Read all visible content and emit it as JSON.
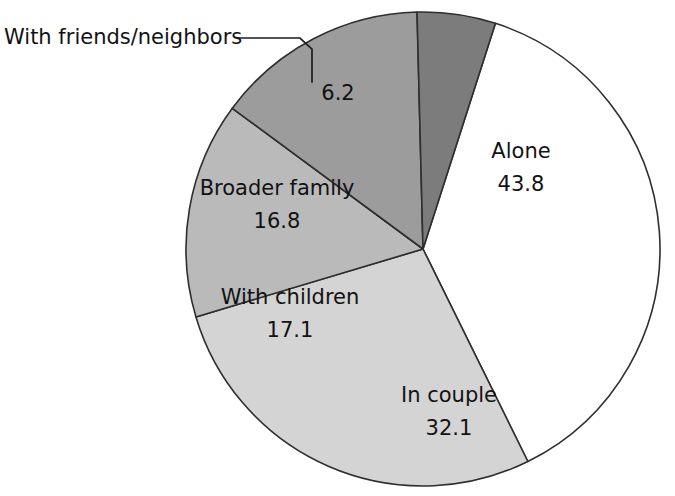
{
  "chart_data": {
    "type": "pie",
    "title": "",
    "subtitle": "",
    "xlabel": "",
    "ylabel": "",
    "grid": false,
    "legend_position": "none",
    "label_style": "inside-slice-with-callout",
    "categories": [
      "Alone",
      "In couple",
      "With children",
      "Broader family",
      "With friends/neighbors"
    ],
    "values": [
      43.8,
      32.1,
      17.1,
      16.8,
      6.2
    ],
    "slices": [
      {
        "label": "Alone",
        "value": "43.8",
        "value_number": 43.8,
        "color": "#ffffff",
        "label_inside": true,
        "start_angle_deg": -74,
        "end_angle_deg": 61.8
      },
      {
        "label": "In couple",
        "value": "32.1",
        "value_number": 32.1,
        "color": "#d4d4d4",
        "label_inside": true,
        "start_angle_deg": 61.8,
        "end_angle_deg": 161.4
      },
      {
        "label": "With children",
        "value": "17.1",
        "value_number": 17.1,
        "color": "#bababa",
        "label_inside": true,
        "start_angle_deg": 161.4,
        "end_angle_deg": 214.4
      },
      {
        "label": "Broader family",
        "value": "16.8",
        "value_number": 16.8,
        "color": "#9c9c9c",
        "label_inside": true,
        "start_angle_deg": 214.4,
        "end_angle_deg": 266.8
      },
      {
        "label": "With friends/neighbors",
        "value": "6.2",
        "value_number": 6.2,
        "color": "#7c7c7c",
        "label_inside": false,
        "start_angle_deg": 266.8,
        "end_angle_deg": 286
      }
    ],
    "callout": {
      "label": "With friends/neighbors",
      "has_leader_line": true
    }
  },
  "geometry": {
    "center_x": 423,
    "center_y": 249,
    "radius": 237
  },
  "labels": {
    "alone_label": "Alone",
    "alone_value": "43.8",
    "in_couple_label": "In couple",
    "in_couple_value": "32.1",
    "with_children_label": "With children",
    "with_children_value": "17.1",
    "broader_family_label": "Broader family",
    "broader_family_value": "16.8",
    "friends_neighbors_label": "With friends/neighbors",
    "friends_neighbors_value": "6.2"
  }
}
